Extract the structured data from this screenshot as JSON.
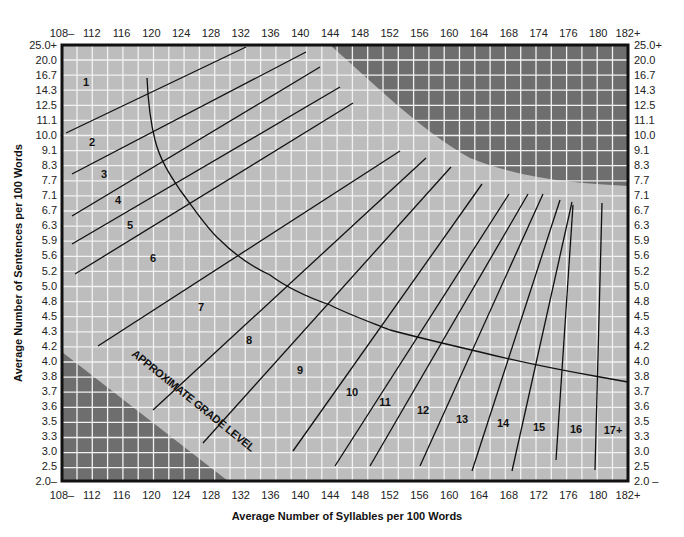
{
  "chart_data": {
    "type": "line",
    "title": "",
    "xlabel": "Average Number of Syllables per 100 Words",
    "ylabel": "Average Number of Sentences per 100 Words",
    "x_ticks": [
      "108–",
      "112",
      "116",
      "120",
      "124",
      "128",
      "132",
      "136",
      "140",
      "144",
      "148",
      "152",
      "156",
      "160",
      "164",
      "168",
      "172",
      "176",
      "180",
      "182+"
    ],
    "x_ticks_top": [
      "108–",
      "112",
      "116",
      "120",
      "124",
      "128",
      "132",
      "136",
      "140",
      "144",
      "148",
      "152",
      "156",
      "160",
      "164",
      "168",
      "174",
      "176",
      "180",
      "182+"
    ],
    "y_ticks": [
      "25.0+",
      "20.0",
      "16.7",
      "14.3",
      "12.5",
      "11.1",
      "10.0",
      "9.1",
      "8.3",
      "7.7",
      "7.1",
      "6.7",
      "6.3",
      "5.9",
      "5.6",
      "5.2",
      "5.0",
      "4.8",
      "4.5",
      "4.3",
      "4.2",
      "4.0",
      "3.8",
      "3.7",
      "3.6",
      "3.5",
      "3.3",
      "3.0",
      "2.5",
      "2.0–"
    ],
    "y_ticks_right": [
      "25.0+",
      "20.0",
      "16.7",
      "14.3",
      "12.5",
      "11.1",
      "10.0",
      "9.1",
      "8.3",
      "7.7",
      "7.1",
      "6.7",
      "6.3",
      "5.9",
      "5.6",
      "5.2",
      "5.0",
      "4.8",
      "4.5",
      "4.3",
      "4.2",
      "4.0",
      "3.8",
      "3.7",
      "3.6",
      "3.5",
      "3.3",
      "3.0",
      "2.5",
      "2.0 –"
    ],
    "annotation": "APPROXIMATE GRADE LEVEL",
    "grade_levels": [
      "1",
      "2",
      "3",
      "4",
      "5",
      "6",
      "7",
      "8",
      "9",
      "10",
      "11",
      "12",
      "13",
      "14",
      "15",
      "16",
      "17+"
    ],
    "grid": true,
    "legend": "none",
    "colors": {
      "valid_region": "#bdbdbd",
      "invalid_region": "#6e6e6e",
      "grid_line": "#f2f2f2",
      "frame": "#111111",
      "line": "#111111"
    },
    "regions": {
      "invalid_top_right": "high syllables & high sentences (top-right corner, dark)",
      "invalid_bottom_left": "low syllables & low sentences (bottom-left corner, dark)"
    }
  },
  "labels": {
    "x_axis_title": "Average Number of Syllables per 100 Words",
    "y_axis_title": "Average Number of Sentences per 100 Words",
    "annotation": "APPROXIMATE GRADE LEVEL"
  }
}
